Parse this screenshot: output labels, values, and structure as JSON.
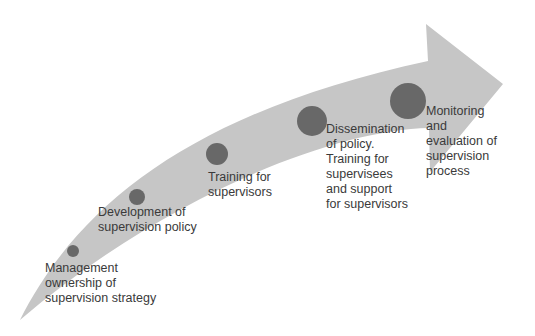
{
  "diagram": {
    "type": "curved-arrow-timeline",
    "colors": {
      "arrow": "#c6c6c6",
      "marker": "#686868",
      "text": "#3a3a3a"
    },
    "steps": [
      {
        "id": 1,
        "label": "Management\nownership of\nsupervision strategy",
        "marker": {
          "cx": 73,
          "cy": 251,
          "r": 6
        }
      },
      {
        "id": 2,
        "label": "Development of\nsupervision policy",
        "marker": {
          "cx": 137,
          "cy": 197,
          "r": 8
        }
      },
      {
        "id": 3,
        "label": "Training for\nsupervisors",
        "marker": {
          "cx": 217,
          "cy": 154,
          "r": 11
        }
      },
      {
        "id": 4,
        "label": "Dissemination\nof policy.\nTraining for\nsupervisees\nand support\nfor supervisors",
        "marker": {
          "cx": 312,
          "cy": 121,
          "r": 15
        }
      },
      {
        "id": 5,
        "label": "Monitoring\nand\nevaluation of\nsupervision\nprocess",
        "marker": {
          "cx": 408,
          "cy": 101,
          "r": 18
        }
      }
    ]
  }
}
